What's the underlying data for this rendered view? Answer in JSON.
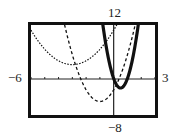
{
  "chart_data": {
    "type": "line",
    "title": "",
    "xlabel": "",
    "ylabel": "",
    "xlim": [
      -6,
      3
    ],
    "ylim": [
      -8,
      12
    ],
    "grid": false,
    "x_ticks_step": 1,
    "y_ticks_step": 0,
    "legend": null,
    "series": [
      {
        "name": "dotted parabola",
        "style": "dotted",
        "width": 1.2,
        "vertex": [
          -3,
          3.2
        ],
        "a": 0.85
      },
      {
        "name": "dashed parabola",
        "style": "dashed",
        "width": 1.3,
        "vertex": [
          -1,
          -5
        ],
        "a": 2.6
      },
      {
        "name": "thick solid parabola",
        "style": "solid",
        "width": 3.2,
        "vertex": [
          0.5,
          -2
        ],
        "a": 8.5
      }
    ],
    "tick_labels": {
      "xmin": "−6",
      "xmax": "3",
      "ymax": "12",
      "ymin": "−8"
    }
  },
  "labels": {
    "xmin": "−6",
    "xmax": "3",
    "ymax": "12",
    "ymin": "−8"
  }
}
